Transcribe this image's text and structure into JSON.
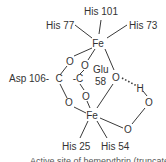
{
  "diagram": {
    "atoms": {
      "fe_top": "Fe",
      "fe_bottom": "Fe",
      "o_asp_top": "O",
      "o_asp_bottom": "O",
      "c_asp": "C",
      "o_glu_top": "O",
      "o_glu_bottom": "O",
      "c_glu": "-C",
      "o_bridge": "O",
      "h_hydroxo": "H",
      "o_peroxo_top": "O",
      "o_peroxo_bottom": "O"
    },
    "ligands": {
      "his101": "His 101",
      "his77": "His 77",
      "his73": "His 73",
      "asp106": "Asp 106-",
      "glu58_line1": "Glu",
      "glu58_line2": "58",
      "his25": "His 25",
      "his54": "His 54"
    },
    "caption": "Active site of hemerythrin (truncated)"
  }
}
